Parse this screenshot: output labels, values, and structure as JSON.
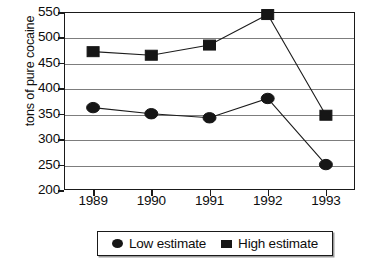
{
  "chart_data": {
    "type": "line",
    "title": "",
    "xlabel": "",
    "ylabel": "tons of pure cocaine",
    "categories": [
      "1989",
      "1990",
      "1991",
      "1992",
      "1993"
    ],
    "series": [
      {
        "name": "Low estimate",
        "marker": "circle",
        "values": [
          362,
          350,
          342,
          380,
          250
        ]
      },
      {
        "name": "High estimate",
        "marker": "square",
        "values": [
          472,
          465,
          485,
          545,
          347
        ]
      }
    ],
    "ylim": [
      200,
      550
    ],
    "ytick_step": 50,
    "yticks": [
      "550",
      "500",
      "450",
      "400",
      "350",
      "300",
      "250",
      "200"
    ],
    "grid": true,
    "legend_position": "bottom",
    "legend": [
      {
        "label": "Low estimate",
        "marker": "circle-marker"
      },
      {
        "label": "High estimate",
        "marker": "square-marker"
      }
    ],
    "colors": {
      "marker": "#161616",
      "line": "#1c1c1c",
      "gridline": "#7d7d7d",
      "frame": "#1a1a1a",
      "background": "#ffffff"
    }
  }
}
